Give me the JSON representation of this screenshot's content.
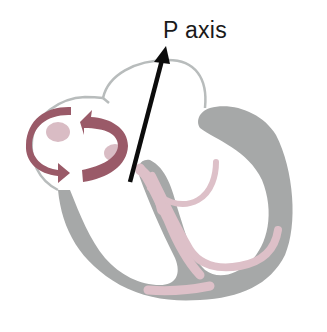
{
  "diagram": {
    "axis_label": "P axis",
    "elements": [
      {
        "name": "atria-outline",
        "description": "two atrial chambers drawn as light gray outline"
      },
      {
        "name": "ventricle-wall",
        "description": "gray ventricular myocardium"
      },
      {
        "name": "conduction-system",
        "description": "pink conduction pathways (bundle branches)"
      },
      {
        "name": "rotation-arrows",
        "description": "two curved mauve arrows indicating circular depolarization in the right atrium"
      },
      {
        "name": "p-axis-arrow",
        "description": "black arrow indicating the P axis direction"
      }
    ],
    "colors": {
      "outline": "#b8bcbc",
      "ventricle": "#a6a8a8",
      "conduction": "#ddc0c8",
      "rotation_arrow": "#9a5a68",
      "rotation_arrow_light": "#d9bcc4",
      "axis_arrow": "#0c0c0c",
      "text": "#1a1a1a"
    }
  }
}
